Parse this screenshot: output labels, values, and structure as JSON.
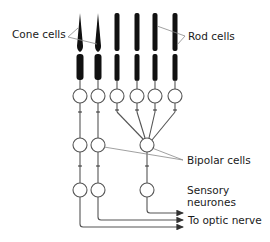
{
  "labels": {
    "cone_cells": "Cone cells",
    "rod_cells": "Rod cells",
    "bipolar_cells": "Bipolar cells",
    "sensory_neurones_line1": "Sensory",
    "sensory_neurones_line2": "neurones",
    "optic_nerve": "To optic nerve"
  },
  "structure": {
    "photoreceptors": [
      {
        "type": "cone",
        "x": 80
      },
      {
        "type": "cone",
        "x": 98
      },
      {
        "type": "rod",
        "x": 117
      },
      {
        "type": "rod",
        "x": 137
      },
      {
        "type": "rod",
        "x": 155
      },
      {
        "type": "rod",
        "x": 175
      }
    ],
    "bipolar_cells": [
      {
        "connects": [
          "cone-1"
        ]
      },
      {
        "connects": [
          "cone-2"
        ]
      },
      {
        "connects": [
          "rod-1",
          "rod-2",
          "rod-3",
          "rod-4"
        ]
      }
    ],
    "sensory_neurones": 3,
    "outputs": 3
  },
  "colors": {
    "cell_fill": "#111111",
    "line": "#555555",
    "leader": "#888888"
  }
}
